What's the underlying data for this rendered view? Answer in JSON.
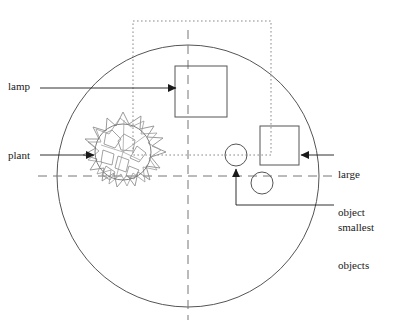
{
  "figure": {
    "type": "technical-line-diagram",
    "background_color": "#ffffff",
    "line_color": "#4d4d4d",
    "text_color": "#1a1a1a"
  },
  "labels": {
    "lamp": "lamp",
    "plant": "plant",
    "large_object_line1": "large",
    "large_object_line2": "object",
    "smallest_objects_line1": "smallest",
    "smallest_objects_line2": "objects"
  },
  "shapes": {
    "enclosure_circle": {
      "name": "enclosure-circle",
      "cx": 188,
      "cy": 176,
      "r": 131
    },
    "vertical_axis": {
      "name": "vertical-centre-axis",
      "x": 188,
      "y1": 30,
      "y2": 320,
      "style": "dashed"
    },
    "horizontal_axis": {
      "name": "horizontal-centre-axis",
      "y": 176,
      "x1": 38,
      "x2": 338,
      "style": "dashed"
    },
    "dotted_rectangle": {
      "name": "dotted-boundary-rectangle",
      "x": 133,
      "y": 21,
      "width": 138,
      "height": 134,
      "style": "dotted"
    },
    "lamp_square": {
      "name": "lamp-square",
      "x": 175,
      "y": 66,
      "width": 52,
      "height": 51
    },
    "large_object_square": {
      "name": "large-object-square",
      "x": 260,
      "y": 126,
      "width": 39,
      "height": 39
    },
    "small_circle_upper": {
      "name": "small-circle-upper",
      "cx": 236,
      "cy": 155,
      "r": 11
    },
    "small_circle_lower": {
      "name": "small-circle-lower",
      "cx": 262,
      "cy": 183,
      "r": 11
    },
    "plant_circle": {
      "name": "plant-inner-circle",
      "cx": 123,
      "cy": 152,
      "r": 28
    }
  },
  "leaders": {
    "lamp": {
      "name": "lamp-leader",
      "from_x": 40,
      "to_x": 175,
      "y": 88,
      "arrow": "right"
    },
    "plant": {
      "name": "plant-leader",
      "from_x": 40,
      "to_x": 93,
      "y": 155,
      "arrow": "right"
    },
    "large_object": {
      "name": "large-object-leader",
      "from_x": 334,
      "to_x": 300,
      "y": 155,
      "arrow": "left"
    },
    "smallest_objects": {
      "name": "smallest-objects-leader",
      "text_x": 334,
      "text_y": 205,
      "corner_x": 236,
      "arrow_y": 168,
      "arrow": "up"
    }
  }
}
